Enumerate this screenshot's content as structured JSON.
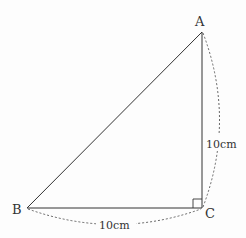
{
  "diagram": {
    "type": "right-triangle",
    "vertices": {
      "A": {
        "label": "A",
        "x": 202,
        "y": 32
      },
      "B": {
        "label": "B",
        "x": 27,
        "y": 208
      },
      "C": {
        "label": "C",
        "x": 202,
        "y": 208
      }
    },
    "right_angle_at": "C",
    "measurements": {
      "AC": "10cm",
      "BC": "10cm"
    },
    "colors": {
      "line": "#333333",
      "dashed": "#555555"
    }
  }
}
